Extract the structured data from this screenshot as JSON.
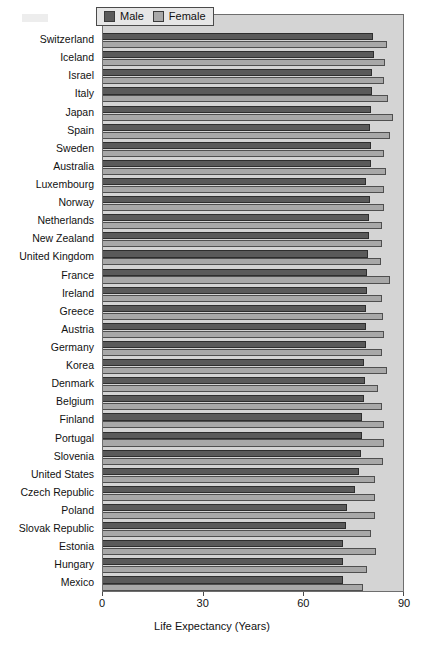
{
  "chart_data": {
    "type": "bar",
    "orientation": "horizontal",
    "title": "",
    "xlabel": "Life Expectancy (Years)",
    "ylabel": "",
    "xlim": [
      0,
      90
    ],
    "xticks": [
      0,
      30,
      60,
      90
    ],
    "xticklabels": [
      "0",
      "30",
      "60",
      "90"
    ],
    "grid": false,
    "legend_position": "top-center",
    "categories": [
      "Switzerland",
      "Iceland",
      "Israel",
      "Italy",
      "Japan",
      "Spain",
      "Sweden",
      "Australia",
      "Luxembourg",
      "Norway",
      "Netherlands",
      "New Zealand",
      "United Kingdom",
      "France",
      "Ireland",
      "Greece",
      "Austria",
      "Germany",
      "Korea",
      "Denmark",
      "Belgium",
      "Finland",
      "Portugal",
      "Slovenia",
      "United States",
      "Czech Republic",
      "Poland",
      "Slovak Republic",
      "Estonia",
      "Hungary",
      "Mexico"
    ],
    "series": [
      {
        "name": "Male",
        "color": "#5a5a5a",
        "values": [
          80.5,
          80.7,
          80.3,
          80.2,
          79.9,
          79.5,
          79.9,
          79.9,
          78.5,
          79.5,
          79.3,
          79.3,
          79.1,
          78.7,
          78.7,
          78.5,
          78.4,
          78.4,
          77.9,
          78.1,
          77.8,
          77.3,
          77.3,
          76.8,
          76.4,
          75.1,
          72.7,
          72.5,
          71.4,
          71.6,
          71.5
        ]
      },
      {
        "name": "Female",
        "color": "#a8a8a8",
        "values": [
          84.7,
          83.9,
          83.6,
          85.0,
          86.4,
          85.5,
          83.7,
          84.3,
          83.6,
          83.6,
          83.0,
          83.0,
          82.8,
          85.4,
          83.2,
          83.4,
          83.6,
          83.2,
          84.6,
          82.1,
          83.1,
          83.8,
          83.6,
          83.3,
          81.2,
          81.1,
          81.1,
          79.9,
          81.5,
          78.7,
          77.4
        ]
      }
    ]
  },
  "legend": {
    "entries": [
      {
        "label": "Male",
        "swatch": "legend-swatch-male"
      },
      {
        "label": "Female",
        "swatch": "legend-swatch-female"
      }
    ]
  },
  "axis": {
    "x_title": "Life Expectancy (Years)"
  }
}
